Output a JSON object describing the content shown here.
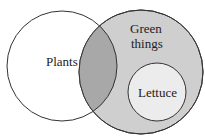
{
  "diagram": {
    "type": "venn",
    "sets": [
      {
        "label": "Plants"
      },
      {
        "label_line1": "Green",
        "label_line2": "things"
      },
      {
        "label": "Lettuce"
      }
    ],
    "colors": {
      "outline": "#333333",
      "plants_fill": "#ffffff",
      "green_fill": "#cfcfcf",
      "overlap_fill": "#a8a8a8",
      "lettuce_fill": "#ececec"
    }
  }
}
